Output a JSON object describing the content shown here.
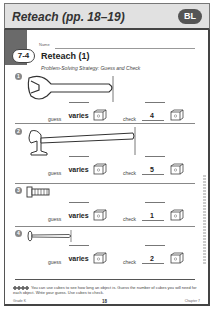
{
  "header": {
    "title": "Reteach (pp. 18–19)",
    "badge": "BL"
  },
  "tab": {
    "label": "7-4"
  },
  "sheet": {
    "name_label": "Name",
    "title": "Reteach (1)",
    "subtitle": "Problem-Solving Strategy: Guess and Check"
  },
  "items": [
    {
      "number": "1",
      "object": "wrench",
      "guess_label": "guess",
      "guess_value": "varies",
      "check_label": "check",
      "check_value": "4"
    },
    {
      "number": "2",
      "object": "hammer",
      "guess_label": "guess",
      "guess_value": "varies",
      "check_label": "check",
      "check_value": "5"
    },
    {
      "number": "3",
      "object": "bolt",
      "guess_label": "guess",
      "guess_value": "varies",
      "check_label": "check",
      "check_value": "1"
    },
    {
      "number": "4",
      "object": "nail",
      "guess_label": "guess",
      "guess_value": "varies",
      "check_label": "check",
      "check_value": "2"
    }
  ],
  "footer": {
    "instructions": "You can use cubes to see how long an object is. Guess the number of cubes you will need for each object. Write your guess. Use cubes to check.",
    "grade": "Grade K",
    "page": "18",
    "chapter": "Chapter 7"
  }
}
